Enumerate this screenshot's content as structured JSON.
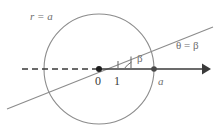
{
  "figure": {
    "kind": "polar-coordinate-diagram",
    "labels": {
      "circle_equation": "r = a",
      "ray_equation": "θ = β",
      "angle_symbol": "β",
      "origin": "0",
      "unit": "1",
      "radius_point": "a"
    },
    "colors": {
      "stroke_light": "#8c8c8c",
      "stroke_dark": "#3a3a3a",
      "text": "#6e6e6e",
      "background": "#ffffff"
    },
    "geometry": {
      "circle_center_x": 99,
      "circle_center_y": 69,
      "circle_radius": 55,
      "origin_point_x": 99,
      "origin_point_y": 69,
      "radius_point_x": 154,
      "radius_point_y": 69,
      "tick_unit_x": 118,
      "tick_angle_x": 131,
      "axis_dash_start_x": 22,
      "axis_arrow_tip_x": 211,
      "ray_start_x": 7,
      "ray_start_y": 109,
      "ray_end_x": 213,
      "ray_end_y": 27
    }
  }
}
